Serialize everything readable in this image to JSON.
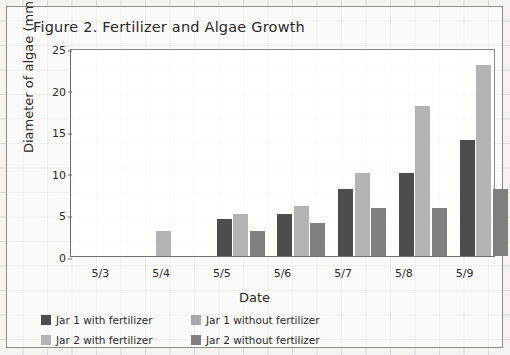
{
  "figure": {
    "title": "Figure 2. Fertilizer and Algae Growth"
  },
  "axes": {
    "ylabel": "Diameter of algae (mm)",
    "xlabel": "Date",
    "yticks": [
      "0",
      "5",
      "10",
      "15",
      "20",
      "25"
    ],
    "xticks": [
      "5/3",
      "5/4",
      "5/5",
      "5/6",
      "5/7",
      "5/8",
      "5/9"
    ]
  },
  "legend": {
    "items": [
      {
        "label": "Jar 1 with fertilizer",
        "color": "#4d4d4d"
      },
      {
        "label": "Jar 1 without fertilizer",
        "color": "#a8a8a8"
      },
      {
        "label": "Jar 2 with fertilizer",
        "color": "#b3b3b3"
      },
      {
        "label": "Jar 2 without fertilizer",
        "color": "#808080"
      }
    ]
  },
  "chart_data": {
    "type": "bar",
    "title": "Figure 2. Fertilizer and Algae Growth",
    "xlabel": "Date",
    "ylabel": "Diameter of algae (mm)",
    "categories": [
      "5/3",
      "5/4",
      "5/5",
      "5/6",
      "5/7",
      "5/8",
      "5/9"
    ],
    "ylim": [
      0,
      25
    ],
    "yticks": [
      0,
      5,
      10,
      15,
      20,
      25
    ],
    "grid": false,
    "legend_position": "bottom",
    "series": [
      {
        "name": "Jar 1 with fertilizer",
        "color": "#4d4d4d",
        "values": [
          0,
          0,
          4.5,
          5,
          8,
          10,
          14
        ]
      },
      {
        "name": "Jar 1 without fertilizer",
        "color": "#a8a8a8",
        "values": [
          0,
          0,
          0,
          0,
          0,
          0,
          0
        ]
      },
      {
        "name": "Jar 2 with fertilizer",
        "color": "#b3b3b3",
        "values": [
          0,
          3,
          5,
          6,
          10,
          18,
          23
        ]
      },
      {
        "name": "Jar 2 without fertilizer",
        "color": "#808080",
        "values": [
          0,
          0,
          3,
          4,
          5.8,
          5.8,
          8
        ]
      }
    ]
  }
}
